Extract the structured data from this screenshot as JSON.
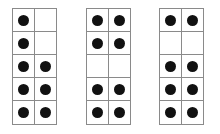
{
  "colors": {
    "dot": "#111111",
    "grid": "#8a8a8a",
    "background": "#ffffff"
  },
  "frames": [
    {
      "name": "ten-frame-1",
      "left": 12,
      "rows": 5,
      "cols": 2,
      "cells": [
        [
          1,
          0
        ],
        [
          1,
          0
        ],
        [
          1,
          1
        ],
        [
          1,
          1
        ],
        [
          1,
          1
        ]
      ],
      "count": 8
    },
    {
      "name": "ten-frame-2",
      "left": 86,
      "rows": 5,
      "cols": 2,
      "cells": [
        [
          1,
          1
        ],
        [
          1,
          1
        ],
        [
          0,
          0
        ],
        [
          1,
          1
        ],
        [
          1,
          1
        ]
      ],
      "count": 8
    },
    {
      "name": "ten-frame-3",
      "left": 159,
      "rows": 5,
      "cols": 2,
      "cells": [
        [
          1,
          1
        ],
        [
          0,
          0
        ],
        [
          1,
          1
        ],
        [
          1,
          1
        ],
        [
          1,
          1
        ]
      ],
      "count": 8
    }
  ]
}
